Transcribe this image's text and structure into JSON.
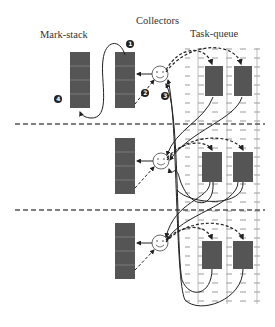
{
  "labels": {
    "mark_stack": "Mark-stack",
    "collectors": "Collectors",
    "task_queue": "Task-queue"
  },
  "markers": [
    "1",
    "2",
    "3",
    "4"
  ],
  "colors": {
    "block_fill": "#555555",
    "block_line": "#7a7a7a",
    "line": "#222222",
    "dash_grid": "#9a9a9a",
    "divider": "#555555"
  },
  "structure": {
    "rows": 3,
    "collector_icon": "smiley-face",
    "queues_per_row": 2,
    "mark_stack_cells": 4
  }
}
